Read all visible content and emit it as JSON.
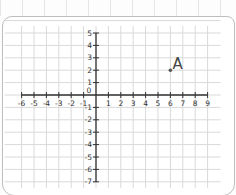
{
  "chart_data": {
    "type": "scatter",
    "title": "",
    "xlabel": "",
    "ylabel": "",
    "xlim": [
      -6,
      9
    ],
    "ylim": [
      -7,
      5
    ],
    "grid": true,
    "x_ticks": [
      "-6",
      "-5",
      "-4",
      "-3",
      "-2",
      "-1",
      "1",
      "2",
      "3",
      "4",
      "5",
      "6",
      "7",
      "8",
      "9"
    ],
    "y_ticks": [
      "5",
      "4",
      "3",
      "2",
      "1",
      "-1",
      "-2",
      "-3",
      "-4",
      "-5",
      "-6",
      "-7"
    ],
    "origin_label": "0",
    "points": [
      {
        "label": "A",
        "x": 6,
        "y": 2
      }
    ]
  },
  "colors": {
    "grid": "#d9d9d9",
    "axis": "#333333",
    "point": "#555555"
  }
}
